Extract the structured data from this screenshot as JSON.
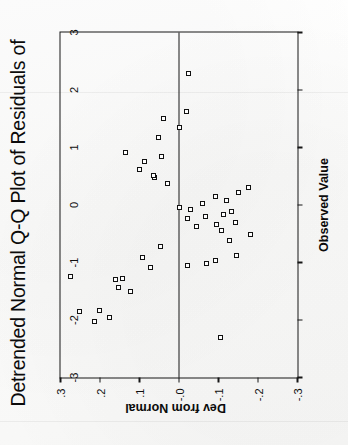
{
  "figure": {
    "title": "Detrended Normal Q-Q Plot of Residuals of",
    "title_note": "title is clipped at the image edge",
    "background_color": "#fdfdfd",
    "ink_color": "#161616",
    "marker_color": "#111111",
    "marker_fill": "#ffffff",
    "rotation_degrees": -90
  },
  "chart_data": {
    "type": "scatter",
    "title": "Detrended Normal Q-Q Plot of Residuals of",
    "xlabel": "Observed Value",
    "ylabel": "Dev from Normal",
    "xlim": [
      -3,
      3
    ],
    "ylim": [
      -0.3,
      0.3
    ],
    "grid": false,
    "legend": null,
    "reference_line": {
      "orientation": "horizontal",
      "y": 0.0
    },
    "xticks": [
      -3,
      -2,
      -1,
      0,
      1,
      2,
      3
    ],
    "xticklabels": [
      "-3",
      "-2",
      "-1",
      "0",
      "1",
      "2",
      "3"
    ],
    "yticks": [
      -0.3,
      -0.2,
      -0.1,
      0.0,
      0.1,
      0.2,
      0.3
    ],
    "yticklabels": [
      "-.3",
      "-.2",
      "-.1",
      "-.0",
      ".1",
      ".2",
      ".3"
    ],
    "marker": "open-square",
    "n_points": 46,
    "points": [
      {
        "x": -2.3,
        "y": -0.105
      },
      {
        "x": -2.03,
        "y": 0.215
      },
      {
        "x": -1.95,
        "y": 0.175
      },
      {
        "x": -1.85,
        "y": 0.252
      },
      {
        "x": -1.84,
        "y": 0.202
      },
      {
        "x": -1.5,
        "y": 0.122
      },
      {
        "x": -1.43,
        "y": 0.152
      },
      {
        "x": -1.3,
        "y": 0.16
      },
      {
        "x": -1.28,
        "y": 0.142
      },
      {
        "x": -1.24,
        "y": 0.275
      },
      {
        "x": -1.08,
        "y": 0.073
      },
      {
        "x": -1.05,
        "y": -0.022
      },
      {
        "x": -1.02,
        "y": -0.07
      },
      {
        "x": -0.96,
        "y": -0.093
      },
      {
        "x": -0.92,
        "y": 0.093
      },
      {
        "x": -0.88,
        "y": -0.145
      },
      {
        "x": -0.72,
        "y": 0.048
      },
      {
        "x": -0.62,
        "y": -0.127
      },
      {
        "x": -0.52,
        "y": -0.18
      },
      {
        "x": -0.45,
        "y": -0.108
      },
      {
        "x": -0.37,
        "y": -0.045
      },
      {
        "x": -0.34,
        "y": -0.096
      },
      {
        "x": -0.3,
        "y": -0.143
      },
      {
        "x": -0.24,
        "y": -0.022
      },
      {
        "x": -0.2,
        "y": -0.068
      },
      {
        "x": -0.17,
        "y": -0.112
      },
      {
        "x": -0.12,
        "y": -0.133
      },
      {
        "x": -0.08,
        "y": -0.03
      },
      {
        "x": -0.05,
        "y": 0.0
      },
      {
        "x": 0.02,
        "y": -0.06
      },
      {
        "x": 0.08,
        "y": -0.12
      },
      {
        "x": 0.14,
        "y": -0.093
      },
      {
        "x": 0.22,
        "y": -0.15
      },
      {
        "x": 0.3,
        "y": -0.175
      },
      {
        "x": 0.38,
        "y": 0.03
      },
      {
        "x": 0.47,
        "y": 0.062
      },
      {
        "x": 0.52,
        "y": 0.065
      },
      {
        "x": 0.62,
        "y": 0.1
      },
      {
        "x": 0.76,
        "y": 0.087
      },
      {
        "x": 0.84,
        "y": 0.045
      },
      {
        "x": 0.92,
        "y": 0.135
      },
      {
        "x": 1.18,
        "y": 0.052
      },
      {
        "x": 1.35,
        "y": 0.0
      },
      {
        "x": 1.5,
        "y": 0.04
      },
      {
        "x": 1.62,
        "y": -0.02
      },
      {
        "x": 2.28,
        "y": -0.025
      }
    ]
  }
}
